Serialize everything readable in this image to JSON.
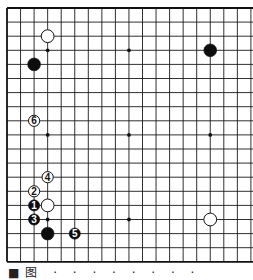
{
  "board": {
    "size": 19,
    "visible_columns": 19,
    "origin_x": 7,
    "origin_y": 8,
    "spacing_x": 13.55,
    "spacing_y": 14.1,
    "line_color": "#1a1a1a",
    "border_color": "#111111",
    "background": "#ffffff",
    "right_edge_cut": true,
    "star_points": [
      {
        "col": 3,
        "row": 3
      },
      {
        "col": 9,
        "row": 3
      },
      {
        "col": 15,
        "row": 3
      },
      {
        "col": 3,
        "row": 9
      },
      {
        "col": 9,
        "row": 9
      },
      {
        "col": 15,
        "row": 9
      },
      {
        "col": 3,
        "row": 15
      },
      {
        "col": 9,
        "row": 15
      },
      {
        "col": 15,
        "row": 15
      }
    ],
    "stones": [
      {
        "col": 3,
        "row": 2,
        "color": "white",
        "label": ""
      },
      {
        "col": 2,
        "row": 4,
        "color": "black",
        "label": ""
      },
      {
        "col": 15,
        "row": 3,
        "color": "black",
        "label": ""
      },
      {
        "col": 15,
        "row": 15,
        "color": "white",
        "label": ""
      },
      {
        "col": 3,
        "row": 14,
        "color": "white",
        "label": ""
      },
      {
        "col": 3,
        "row": 16,
        "color": "black",
        "label": ""
      },
      {
        "col": 2,
        "row": 14,
        "color": "black",
        "label": "1"
      },
      {
        "col": 2,
        "row": 13,
        "color": "white",
        "label": "2"
      },
      {
        "col": 2,
        "row": 15,
        "color": "black",
        "label": "3"
      },
      {
        "col": 3,
        "row": 12,
        "color": "white",
        "label": "4"
      },
      {
        "col": 5,
        "row": 16,
        "color": "black",
        "label": "5"
      },
      {
        "col": 2,
        "row": 8,
        "color": "white",
        "label": "6"
      }
    ]
  },
  "caption": {
    "text": "■图  · · · · · · · ·"
  }
}
